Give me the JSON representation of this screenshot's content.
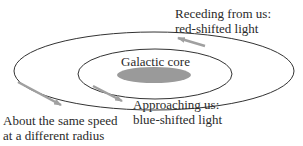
{
  "diagram": {
    "labels": {
      "receding_line1": "Receding from us:",
      "receding_line2": "red-shifted light",
      "core": "Galactic core",
      "approaching_line1": "Approaching us:",
      "approaching_line2": "blue-shifted light",
      "same_speed_line1": "About the same speed",
      "same_speed_line2": "at a different radius"
    },
    "colors": {
      "orbit_line": "#333333",
      "core_fill": "#9a9a9a",
      "arrow": "#a0a0a0"
    }
  }
}
